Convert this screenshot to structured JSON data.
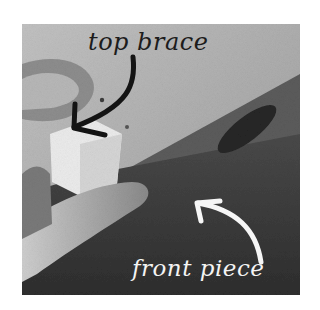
{
  "image": {
    "description": "Grayscale photo of fingers holding a small white top brace against the edge of a wooden front piece, with handwritten annotations",
    "colors": {
      "background": "#ffffff",
      "wall_light": "#b4b4b4",
      "board_top": "#5e5e5e",
      "board_front": "#3a3a3a",
      "brace": "#ededed",
      "finger": "#a8a8a8",
      "dark_annotation": "#1c1c1c",
      "light_annotation": "#f4f4f4"
    }
  },
  "annotations": {
    "top_label": "top brace",
    "bottom_label": "front piece"
  }
}
